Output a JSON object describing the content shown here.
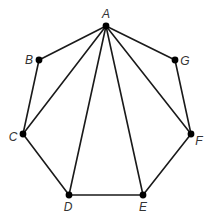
{
  "diagram": {
    "type": "heptagon-with-diagonals",
    "vertices": [
      {
        "id": "A",
        "label": "A",
        "x": 106,
        "y": 26,
        "lx": 106,
        "ly": 18,
        "anchor": "middle"
      },
      {
        "id": "B",
        "label": "B",
        "x": 39,
        "y": 60,
        "lx": 29,
        "ly": 64,
        "anchor": "middle"
      },
      {
        "id": "C",
        "label": "C",
        "x": 23,
        "y": 134,
        "lx": 13,
        "ly": 141,
        "anchor": "middle"
      },
      {
        "id": "D",
        "label": "D",
        "x": 69,
        "y": 195,
        "lx": 68,
        "ly": 211,
        "anchor": "middle"
      },
      {
        "id": "E",
        "label": "E",
        "x": 143,
        "y": 195,
        "lx": 143,
        "ly": 211,
        "anchor": "middle"
      },
      {
        "id": "F",
        "label": "F",
        "x": 191,
        "y": 134,
        "lx": 199,
        "ly": 145,
        "anchor": "middle"
      },
      {
        "id": "G",
        "label": "G",
        "x": 175,
        "y": 60,
        "lx": 185,
        "ly": 65,
        "anchor": "middle"
      }
    ],
    "edges": [
      [
        "A",
        "B"
      ],
      [
        "B",
        "C"
      ],
      [
        "C",
        "D"
      ],
      [
        "D",
        "E"
      ],
      [
        "E",
        "F"
      ],
      [
        "F",
        "G"
      ],
      [
        "G",
        "A"
      ],
      [
        "A",
        "C"
      ],
      [
        "A",
        "D"
      ],
      [
        "A",
        "E"
      ],
      [
        "A",
        "F"
      ]
    ],
    "colors": {
      "stroke": "#1a1a1a",
      "vertex": "#000000",
      "label": "#333333"
    }
  }
}
